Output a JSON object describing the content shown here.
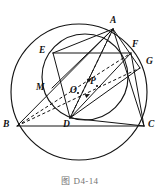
{
  "figure": {
    "caption": "图 D4-14",
    "background_color": "#ffffff",
    "stroke_color": "#141414",
    "width": 160,
    "height": 187
  },
  "points": [
    {
      "id": "A",
      "label": "A",
      "x": 113,
      "y": 29,
      "label_x": 110,
      "label_y": 16
    },
    {
      "id": "B",
      "label": "B",
      "x": 17,
      "y": 126,
      "label_x": 4,
      "label_y": 121
    },
    {
      "id": "C",
      "label": "C",
      "x": 144,
      "y": 126,
      "label_x": 148,
      "label_y": 121
    },
    {
      "id": "D",
      "label": "D",
      "x": 70,
      "y": 118,
      "label_x": 64,
      "label_y": 120
    },
    {
      "id": "E",
      "label": "E",
      "x": 53,
      "y": 53,
      "label_x": 40,
      "label_y": 47
    },
    {
      "id": "F",
      "label": "F",
      "x": 131,
      "y": 53,
      "label_x": 132,
      "label_y": 41
    },
    {
      "id": "G",
      "label": "G",
      "x": 140,
      "y": 68,
      "label_x": 145,
      "label_y": 58
    },
    {
      "id": "M",
      "label": "M",
      "x": 52,
      "y": 88,
      "label_x": 38,
      "label_y": 84
    },
    {
      "id": "O",
      "label": "O",
      "x": 78,
      "y": 93,
      "label_x": 71,
      "label_y": 88
    },
    {
      "id": "P",
      "label": "P",
      "x": 97,
      "y": 86,
      "label_x": 91,
      "label_y": 79
    }
  ],
  "circles": [
    {
      "id": "outer-circumcircle",
      "cx": 79,
      "cy": 92,
      "r": 68
    },
    {
      "id": "inner-circle",
      "cx": 85,
      "cy": 77,
      "r": 43
    }
  ],
  "solid_segments": [
    {
      "id": "segment-BC",
      "from": "B",
      "to": "C"
    },
    {
      "id": "segment-EF",
      "from": "E",
      "to": "F"
    },
    {
      "id": "segment-AB",
      "from": "A",
      "to": "B"
    },
    {
      "id": "segment-AC",
      "from": "A",
      "to": "C"
    },
    {
      "id": "segment-AD",
      "from": "A",
      "to": "D"
    },
    {
      "id": "segment-AE",
      "from": "A",
      "to": "E"
    },
    {
      "id": "segment-AM",
      "from": "A",
      "to": "M"
    },
    {
      "id": "segment-DE",
      "from": "D",
      "to": "E"
    },
    {
      "id": "segment-DF",
      "from": "D",
      "to": "F"
    },
    {
      "id": "segment-DG",
      "from": "D",
      "to": "G"
    },
    {
      "id": "segment-DC",
      "from": "D",
      "to": "C"
    },
    {
      "id": "segment-AG",
      "from": "A",
      "to": "G"
    },
    {
      "id": "segment-FC",
      "from": "F",
      "to": "C"
    }
  ],
  "dashed_segments": [
    {
      "id": "dashed-BF",
      "from": "B",
      "to": "F"
    },
    {
      "id": "dashed-BG",
      "from": "B",
      "to": "G"
    },
    {
      "id": "dashed-DA",
      "from": "D",
      "to": "A"
    }
  ],
  "arrow_marks": [
    {
      "id": "arrow-on-BF",
      "x": 87,
      "y": 80,
      "angle": -11
    },
    {
      "id": "arrow-on-BG",
      "x": 86,
      "y": 95,
      "angle": -11
    }
  ]
}
